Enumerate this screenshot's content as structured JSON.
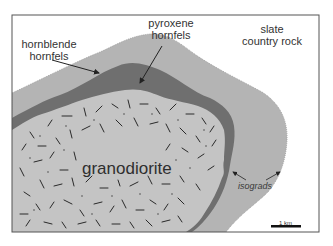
{
  "diagram": {
    "type": "geologic-map",
    "units": [
      {
        "id": "slate",
        "label_line1": "slate",
        "label_line2": "country rock",
        "color": "#ffffff"
      },
      {
        "id": "hornblende",
        "label_line1": "hornblende",
        "label_line2": "hornfels",
        "color": "#b4b4b4"
      },
      {
        "id": "pyroxene",
        "label_line1": "pyroxene",
        "label_line2": "hornfels",
        "color": "#6f6f6f"
      },
      {
        "id": "granodiorite",
        "label": "granodiorite",
        "color": "#c4c4c4",
        "pattern": "random-dashes"
      }
    ],
    "annotations": {
      "isograds": "isograds"
    },
    "scale_bar": {
      "label": "1 km"
    },
    "frame_color": "#555555"
  }
}
